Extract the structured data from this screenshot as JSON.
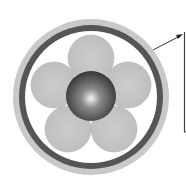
{
  "header": {
    "cropped_title": ""
  },
  "diagram": {
    "type": "cable-cross-section",
    "colors": {
      "outer_sheath": "#c8c8c8",
      "armor_ring": "#555555",
      "filler": "#ffffff",
      "strands": "#c4c4c4",
      "core_dark": "#3a3a3a",
      "core_highlight": "#f0f0f0",
      "callout_line": "#333333"
    },
    "strand_count": 5,
    "callout": {
      "label": ""
    }
  }
}
